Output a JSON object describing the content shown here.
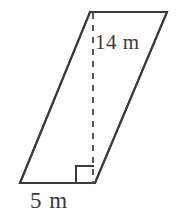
{
  "figure": {
    "type": "geometry-diagram",
    "shape_name": "parallelogram",
    "background_color": "#ffffff",
    "stroke_color": "#3b3b3b",
    "stroke_width": 2,
    "canvas": {
      "width": 177,
      "height": 220
    },
    "vertices": {
      "top_left": {
        "x": 90,
        "y": 12
      },
      "top_right": {
        "x": 167,
        "y": 12
      },
      "bottom_right": {
        "x": 95,
        "y": 183
      },
      "bottom_left": {
        "x": 20,
        "y": 183
      }
    },
    "edges": [
      {
        "name": "top-edge",
        "from": "top_left",
        "to": "top_right",
        "style": "solid"
      },
      {
        "name": "right-edge",
        "from": "top_right",
        "to": "bottom_right",
        "style": "solid"
      },
      {
        "name": "bottom-edge",
        "from": "bottom_right",
        "to": "bottom_left",
        "style": "solid"
      },
      {
        "name": "left-edge",
        "from": "bottom_left",
        "to": "top_left",
        "style": "solid"
      }
    ],
    "height_segment": {
      "name": "height-dashed-line",
      "style": "dashed",
      "dash_pattern": "6 6",
      "from": {
        "x": 93,
        "y": 13
      },
      "to": {
        "x": 93,
        "y": 183
      }
    },
    "right_angle_marker": {
      "name": "right-angle-square",
      "corner": {
        "x": 93,
        "y": 183
      },
      "size": 17,
      "opens_toward": "left"
    },
    "labels": {
      "height": {
        "text": "14 m",
        "value": 14,
        "unit": "m",
        "describes": "perpendicular height",
        "x": 95,
        "y": 32
      },
      "base": {
        "text": "5 m",
        "value": 5,
        "unit": "m",
        "describes": "base length",
        "x": 30,
        "y": 189
      }
    }
  }
}
